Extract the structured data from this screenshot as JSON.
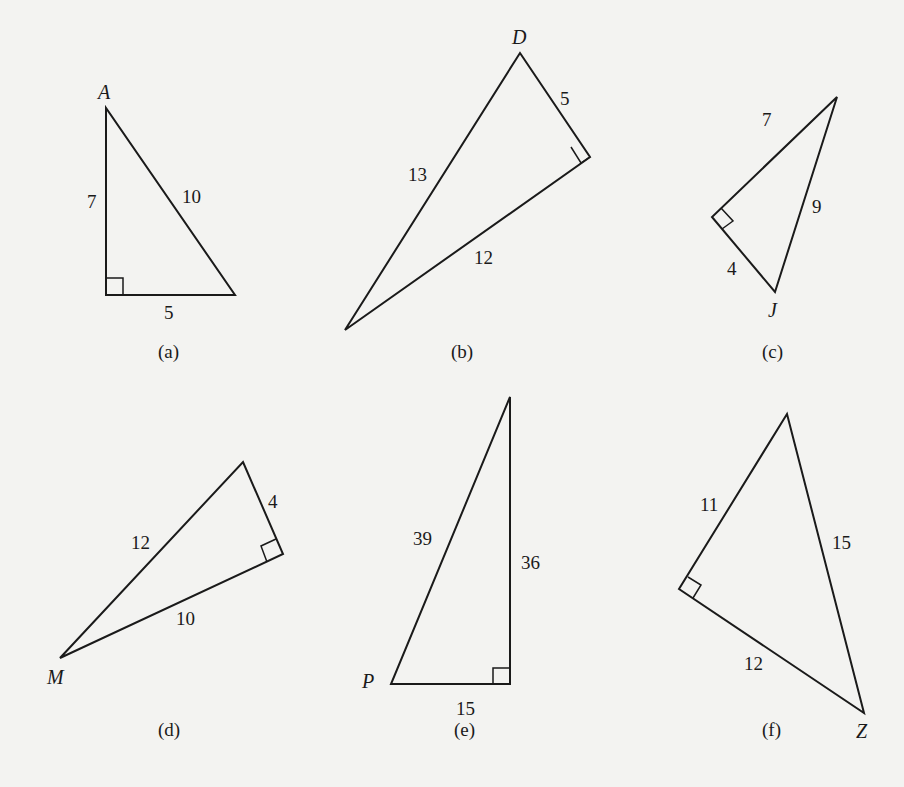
{
  "triangles": [
    {
      "caption": "(a)",
      "vertex_label": "A",
      "sides": {
        "vertical_leg": "7",
        "hypotenuse": "10",
        "horizontal_leg": "5"
      },
      "right_angle": "bottom-left"
    },
    {
      "caption": "(b)",
      "vertex_label": "D",
      "sides": {
        "short_leg": "5",
        "hypotenuse": "13",
        "long_leg": "12"
      },
      "right_angle": "right"
    },
    {
      "caption": "(c)",
      "vertex_label": "J",
      "sides": {
        "upper_leg": "7",
        "hypotenuse": "9",
        "lower_leg": "4"
      },
      "right_angle": "left"
    },
    {
      "caption": "(d)",
      "vertex_label": "M",
      "sides": {
        "short_leg": "4",
        "hypotenuse": "12",
        "long_leg": "10"
      },
      "right_angle": "right"
    },
    {
      "caption": "(e)",
      "vertex_label": "P",
      "sides": {
        "hypotenuse": "39",
        "vertical_leg": "36",
        "horizontal_leg": "15"
      },
      "right_angle": "bottom-right"
    },
    {
      "caption": "(f)",
      "vertex_label": "Z",
      "sides": {
        "upper_leg": "11",
        "hypotenuse": "15",
        "lower_leg": "12"
      },
      "right_angle": "left"
    }
  ]
}
